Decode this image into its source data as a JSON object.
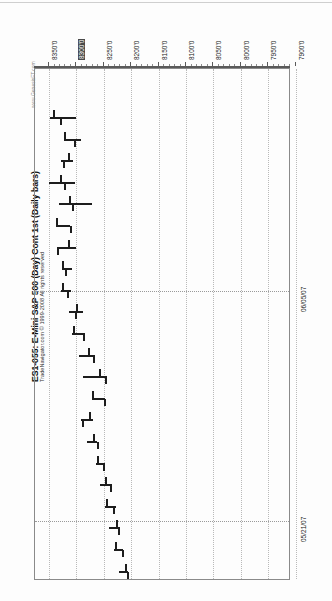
{
  "header": {
    "title": "ES1-055: E-Mini S&P 500 (Day) Cont 1st (Daily bars)",
    "subtitle": "TradeNavigator.com © 1999-2008 All rights reserved",
    "watermark": "www.GenesisFT.com"
  },
  "chart_data": {
    "type": "ohlc",
    "title": "ES1-055: E-Mini S&P 500 (Day) Cont 1st (Daily bars)",
    "xlabel": "",
    "ylabel": "",
    "orientation": "rotated-90ccw",
    "grid": true,
    "price_axis": {
      "position": "top",
      "direction": "descending-left-to-right",
      "ticks": [
        "8350'0",
        "8300'0",
        "8250'0",
        "8200'0",
        "8150'0",
        "8100'0",
        "8050'0",
        "8000'0",
        "7950'0",
        "7900'0"
      ],
      "tick_values": [
        8350,
        8300,
        8250,
        8200,
        8150,
        8100,
        8050,
        8000,
        7950,
        7900
      ],
      "highlighted_tick": "8300'0",
      "ylim": [
        7880,
        8370
      ],
      "minor_ticks_per_interval": 5
    },
    "time_axis": {
      "position": "right",
      "labels": [
        "06/05/07",
        "05/21/07"
      ],
      "label_positions_px": [
        290,
        520
      ]
    },
    "bars": [
      {
        "index": 1,
        "high": 8349,
        "low": 8300,
        "open": 8342,
        "close": 8330
      },
      {
        "index": 2,
        "high": 8323,
        "low": 8292,
        "open": 8322,
        "close": 8305
      },
      {
        "index": 3,
        "high": 8329,
        "low": 8306,
        "open": 8316,
        "close": 8325
      },
      {
        "index": 4,
        "high": 8350,
        "low": 8303,
        "open": 8330,
        "close": 8322
      },
      {
        "index": 5,
        "high": 8332,
        "low": 8272,
        "open": 8314,
        "close": 8308
      },
      {
        "index": 6,
        "high": 8337,
        "low": 8311,
        "open": 8337,
        "close": 8312
      },
      {
        "index": 7,
        "high": 8335,
        "low": 8300,
        "open": 8316,
        "close": 8336
      },
      {
        "index": 8,
        "high": 8327,
        "low": 8308,
        "open": 8327,
        "close": 8320
      },
      {
        "index": 9,
        "high": 8328,
        "low": 8310,
        "open": 8326,
        "close": 8317
      },
      {
        "index": 10,
        "high": 8313,
        "low": 8288,
        "open": 8300,
        "close": 8303
      },
      {
        "index": 11,
        "high": 8308,
        "low": 8285,
        "open": 8306,
        "close": 8288
      },
      {
        "index": 12,
        "high": 8296,
        "low": 8266,
        "open": 8279,
        "close": 8270
      },
      {
        "index": 13,
        "high": 8288,
        "low": 8245,
        "open": 8258,
        "close": 8248
      },
      {
        "index": 14,
        "high": 8271,
        "low": 8247,
        "open": 8271,
        "close": 8249
      },
      {
        "index": 15,
        "high": 8291,
        "low": 8270,
        "open": 8276,
        "close": 8290
      },
      {
        "index": 16,
        "high": 8281,
        "low": 8262,
        "open": 8270,
        "close": 8263
      },
      {
        "index": 17,
        "high": 8265,
        "low": 8248,
        "open": 8263,
        "close": 8251
      },
      {
        "index": 18,
        "high": 8257,
        "low": 8236,
        "open": 8248,
        "close": 8238
      },
      {
        "index": 19,
        "high": 8248,
        "low": 8228,
        "open": 8246,
        "close": 8233
      },
      {
        "index": 20,
        "high": 8240,
        "low": 8221,
        "open": 8228,
        "close": 8224
      },
      {
        "index": 21,
        "high": 8231,
        "low": 8215,
        "open": 8229,
        "close": 8217
      },
      {
        "index": 22,
        "high": 8222,
        "low": 8205,
        "open": 8211,
        "close": 8207
      }
    ]
  }
}
